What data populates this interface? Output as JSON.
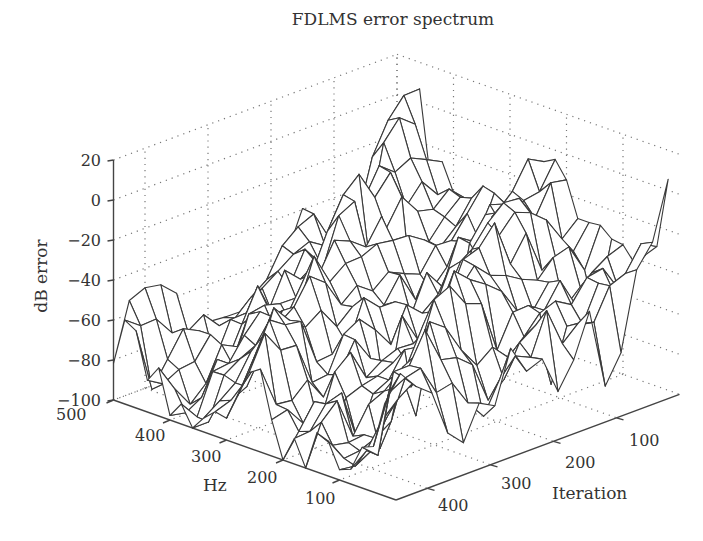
{
  "chart_data": {
    "type": "surface",
    "title": "FDLMS error spectrum",
    "xlabel": "Iteration",
    "ylabel": "Hz",
    "zlabel": "dB error",
    "x_ticks": [
      100,
      200,
      300,
      400
    ],
    "y_ticks": [
      100,
      200,
      300,
      400,
      500
    ],
    "z_ticks": [
      20,
      0,
      -20,
      -40,
      -60,
      -80,
      -100
    ],
    "xlim": [
      0,
      450
    ],
    "ylim": [
      0,
      500
    ],
    "zlim": [
      -100,
      20
    ],
    "grid": true,
    "style": "wireframe mesh, white faces, dark edges",
    "mesh_grid": {
      "hz_values": [
        500,
        480,
        460,
        440,
        420,
        400,
        380,
        360,
        340,
        320,
        300,
        280,
        260,
        240,
        220,
        200,
        180,
        160,
        140,
        120,
        100,
        80,
        60,
        40,
        20
      ],
      "iteration_values": [
        0,
        25,
        50,
        75,
        100,
        125,
        150,
        175,
        200,
        225,
        250,
        275,
        300,
        325,
        350,
        375,
        400,
        425,
        450
      ],
      "note": "dB error values are generated as a smooth approximation: ridges ~ -60..0 dB, valleys ~ -80..-100 dB, rising toward low iteration"
    }
  },
  "labels": {
    "title": "FDLMS error spectrum",
    "zlabel": "dB error",
    "hz_label": "Hz",
    "iter_label": "Iteration",
    "z_ticks": [
      "20",
      "0",
      "−20",
      "−40",
      "−60",
      "−80",
      "−100"
    ],
    "hz_ticks": [
      "500",
      "400",
      "300",
      "200",
      "100"
    ],
    "iter_ticks": [
      "100",
      "200",
      "300",
      "400"
    ]
  }
}
